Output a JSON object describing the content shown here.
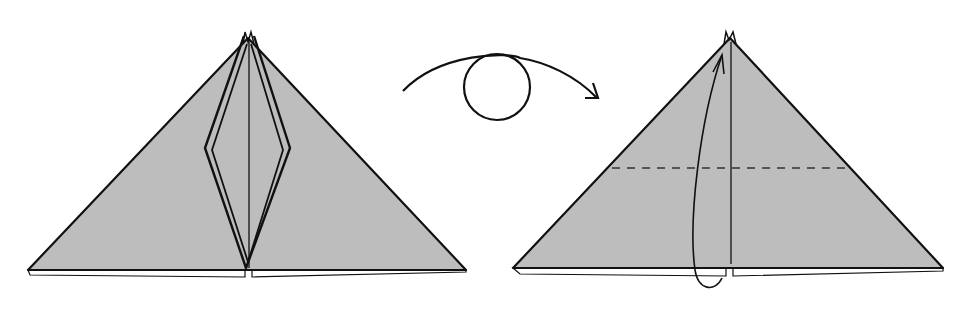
{
  "diagram": {
    "type": "origami-instruction",
    "colors": {
      "paper_fill": "#bdbdbd",
      "line": "#111111",
      "background": "#ffffff"
    },
    "steps": [
      {
        "name": "step-before-turn",
        "description": "Triangle base with inner diamond-shaped flaps folded along center line"
      },
      {
        "name": "turn-over-symbol",
        "description": "Curved arrow with loop indicating turn the model over"
      },
      {
        "name": "step-after-turn",
        "description": "Triangle with horizontal valley-fold dashed line and arrow folding bottom edge up to top point"
      }
    ]
  }
}
